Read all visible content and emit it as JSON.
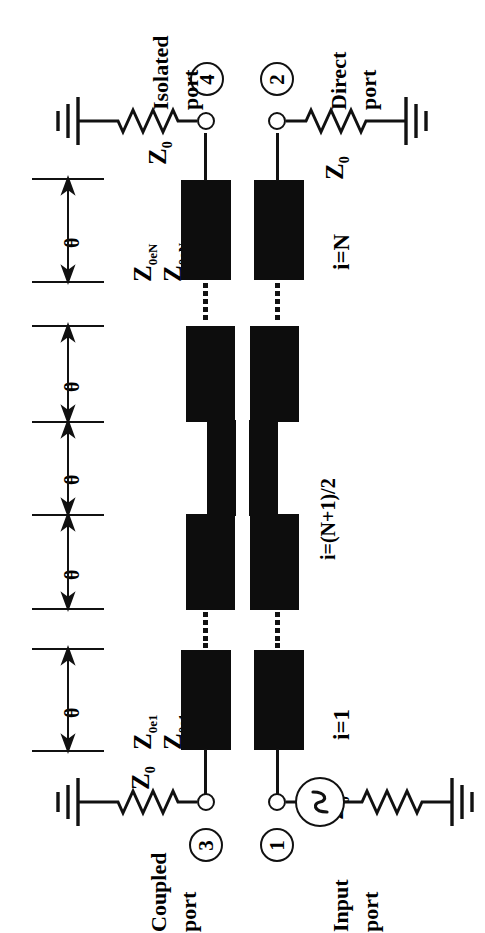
{
  "figure": {
    "type": "schematic-diagram",
    "orientation_deg": -90,
    "ink_color": "#0d0d0d",
    "background_color": "#ffffff"
  },
  "ports": [
    {
      "id": "port-4",
      "number": "4",
      "name": "Isolated port",
      "name_line1": "Isolated",
      "name_line2": "port",
      "termination": "Z0",
      "has_ground": true
    },
    {
      "id": "port-2",
      "number": "2",
      "name": "Direct port",
      "name_line1": "Direct",
      "name_line2": "port",
      "termination": "Z0",
      "has_ground": true
    },
    {
      "id": "port-3",
      "number": "3",
      "name": "Coupled port",
      "name_line1": "Coupled",
      "name_line2": "port",
      "termination": "Z0",
      "has_ground": true
    },
    {
      "id": "port-1",
      "number": "1",
      "name": "Input port",
      "name_line1": "Input",
      "name_line2": "port",
      "termination": "Z0",
      "has_ground": true,
      "has_source": true
    }
  ],
  "terminations": [
    {
      "id": "z0-port4",
      "label": "Z",
      "sub": "0"
    },
    {
      "id": "z0-port2",
      "label": "Z",
      "sub": "0"
    },
    {
      "id": "z0-port3",
      "label": "Z",
      "sub": "0"
    },
    {
      "id": "z0-port1",
      "label": "Z",
      "sub": "0"
    }
  ],
  "impedance_labels": [
    {
      "id": "z0eN",
      "base": "Z",
      "sub": "0eN"
    },
    {
      "id": "z0oN",
      "base": "Z",
      "sub": "0oN"
    },
    {
      "id": "z0e1",
      "base": "Z",
      "sub": "0e1"
    },
    {
      "id": "z0o1",
      "base": "Z",
      "sub": "0o1"
    }
  ],
  "section_labels": [
    {
      "id": "section-N",
      "text": "i=N"
    },
    {
      "id": "section-middle",
      "text": "i=(N+1)/2"
    },
    {
      "id": "section-1",
      "text": "i=1"
    }
  ],
  "theta_markers": [
    {
      "id": "theta-1",
      "symbol": "θ"
    },
    {
      "id": "theta-2",
      "symbol": "θ"
    },
    {
      "id": "theta-3",
      "symbol": "θ"
    },
    {
      "id": "theta-4",
      "symbol": "θ"
    },
    {
      "id": "theta-5",
      "symbol": "θ"
    }
  ],
  "source": {
    "id": "ac-source",
    "symbol": "sine-wave"
  },
  "continuations": [
    {
      "id": "ellipsis-top-left",
      "style": "dotted"
    },
    {
      "id": "ellipsis-top-right",
      "style": "dotted"
    },
    {
      "id": "ellipsis-bottom-left",
      "style": "dotted"
    },
    {
      "id": "ellipsis-bottom-right",
      "style": "dotted"
    }
  ]
}
